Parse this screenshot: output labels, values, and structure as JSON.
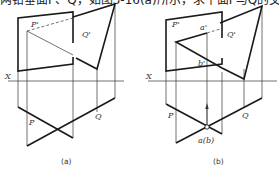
{
  "header_text": "两铅垂面P、Q，如图3-16(a)所示，求平面P与Q的交线",
  "figures": [
    {
      "id": "a",
      "caption": "(a)",
      "labels": {
        "p_front": "P'",
        "q_front": "Q'",
        "axis": "X",
        "p_top": "P",
        "q_top": "Q"
      }
    },
    {
      "id": "b",
      "caption": "(b)",
      "labels": {
        "p_front": "P'",
        "q_front": "Q'",
        "a_front": "a'",
        "b_front": "b'",
        "axis": "X",
        "p_top": "P",
        "q_top": "Q",
        "ab_top": "a(b)"
      }
    }
  ],
  "colors": {
    "line": "#1a1a1a",
    "background": "#ffffff"
  }
}
